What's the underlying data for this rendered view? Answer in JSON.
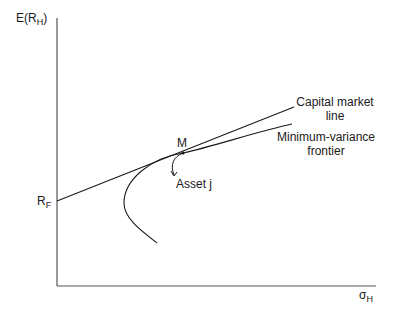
{
  "diagram": {
    "y_axis": {
      "label_main": "E(R",
      "label_sub": "H",
      "label_close": ")"
    },
    "x_axis": {
      "label_main": "σ",
      "label_sub": "H"
    },
    "rf_label": {
      "main": "R",
      "sub": "F"
    },
    "point_m": {
      "label": "M"
    },
    "asset_j": {
      "label": "Asset j"
    },
    "cml_label": {
      "line1": "Capital market",
      "line2": "line"
    },
    "frontier_label": {
      "line1": "Minimum-variance",
      "line2": "frontier"
    },
    "colors": {
      "line": "#1a1a1a",
      "axis": "#555555",
      "background": "#ffffff"
    }
  }
}
